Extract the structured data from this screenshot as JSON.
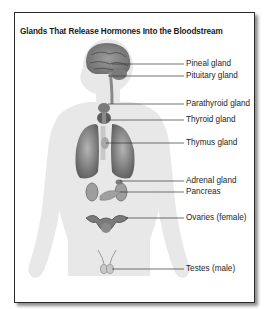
{
  "figure": {
    "title": "Glands That Release Hormones Into the Bloodstream",
    "labels": [
      {
        "id": "pineal",
        "text": "Pineal gland"
      },
      {
        "id": "pituitary",
        "text": "Pituitary gland"
      },
      {
        "id": "parathyroid",
        "text": "Parathyroid gland"
      },
      {
        "id": "thyroid",
        "text": "Thyroid gland"
      },
      {
        "id": "thymus",
        "text": "Thymus gland"
      },
      {
        "id": "adrenal",
        "text": "Adrenal gland"
      },
      {
        "id": "pancreas",
        "text": "Pancreas"
      },
      {
        "id": "ovaries",
        "text": "Ovaries (female)"
      },
      {
        "id": "testes",
        "text": "Testes (male)"
      }
    ],
    "colors": {
      "body_silhouette": "#e6e6e6",
      "organ_dark": "#6a6a6a",
      "organ_mid": "#9a9a9a",
      "leader_line": "#333333",
      "frame_border": "#2a2a2a"
    }
  }
}
